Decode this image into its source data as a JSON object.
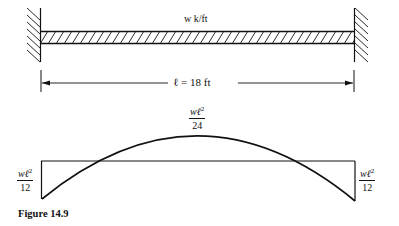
{
  "beam": {
    "load_label": "w k/ft",
    "span_label": "ℓ = 18 ft",
    "supports": [
      "fixed",
      "fixed"
    ],
    "load_type": "uniformly distributed"
  },
  "moment_diagram": {
    "left_end": {
      "num": "wℓ",
      "exp": "2",
      "den": "12"
    },
    "midspan": {
      "num": "wℓ",
      "exp": "2",
      "den": "24"
    },
    "right_end": {
      "num": "wℓ",
      "exp": "2",
      "den": "12"
    }
  },
  "caption": "Figure 14.9",
  "colors": {
    "ink": "#111111",
    "background": "#ffffff"
  }
}
